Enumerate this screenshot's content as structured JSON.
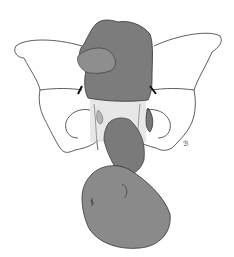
{
  "illustration": {
    "subject": "fetus in breech presentation within pelvis",
    "colors": {
      "background": "#ffffff",
      "line": "#333333",
      "fill": "#8a8a8a",
      "fill_dark": "#6e6e6e"
    },
    "signature": "ℬ"
  }
}
